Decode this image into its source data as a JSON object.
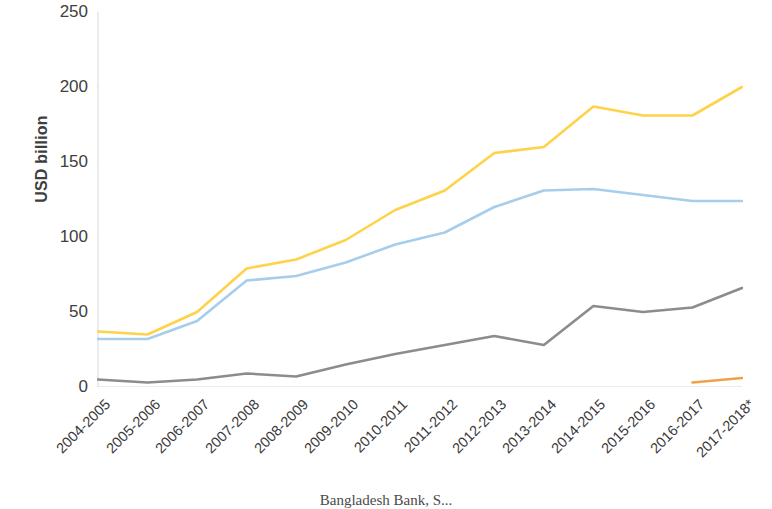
{
  "chart_data": {
    "type": "line",
    "title": "",
    "subtitle": "",
    "xlabel": "",
    "ylabel": "USD billion",
    "ylim": [
      0,
      250
    ],
    "yticks": [
      0,
      50,
      100,
      150,
      200,
      250
    ],
    "grid": false,
    "legend_position": "none",
    "categories": [
      "2004-2005",
      "2005-2006",
      "2006-2007",
      "2007-2008",
      "2008-2009",
      "2009-2010",
      "2010-2011",
      "2011-2012",
      "2012-2013",
      "2013-2014",
      "2014-2015",
      "2015-2016",
      "2016-2017",
      "2017-2018*"
    ],
    "series": [
      {
        "name": "series-yellow",
        "color": "#FFD24A",
        "values": [
          37,
          35,
          50,
          79,
          85,
          98,
          118,
          131,
          156,
          160,
          187,
          181,
          181,
          200
        ]
      },
      {
        "name": "series-blue",
        "color": "#A6CEEC",
        "values": [
          32,
          32,
          44,
          71,
          74,
          83,
          95,
          103,
          120,
          131,
          132,
          128,
          124,
          124
        ]
      },
      {
        "name": "series-gray",
        "color": "#8C8C8C",
        "values": [
          5,
          3,
          5,
          9,
          7,
          15,
          22,
          28,
          34,
          28,
          54,
          50,
          53,
          66
        ]
      },
      {
        "name": "series-orange",
        "color": "#F0A246",
        "values": [
          null,
          null,
          null,
          null,
          null,
          null,
          null,
          null,
          null,
          null,
          null,
          null,
          3,
          6
        ]
      }
    ]
  },
  "axes": {
    "y_title": "USD billion",
    "y_tick_labels": [
      "250",
      "200",
      "150",
      "100",
      "50",
      "0"
    ],
    "x_tick_labels": [
      "2004-2005",
      "2005-2006",
      "2006-2007",
      "2007-2008",
      "2008-2009",
      "2009-2010",
      "2010-2011",
      "2011-2012",
      "2012-2013",
      "2013-2014",
      "2014-2015",
      "2015-2016",
      "2016-2017",
      "2017-2018*"
    ]
  },
  "caption": {
    "text": "Bangladesh Bank, S..."
  },
  "colors": {
    "series_yellow": "#FFD24A",
    "series_blue": "#A6CEEC",
    "series_gray": "#8C8C8C",
    "series_orange": "#F0A246",
    "axis": "#D9D9D9",
    "text": "#3f3f3f"
  }
}
